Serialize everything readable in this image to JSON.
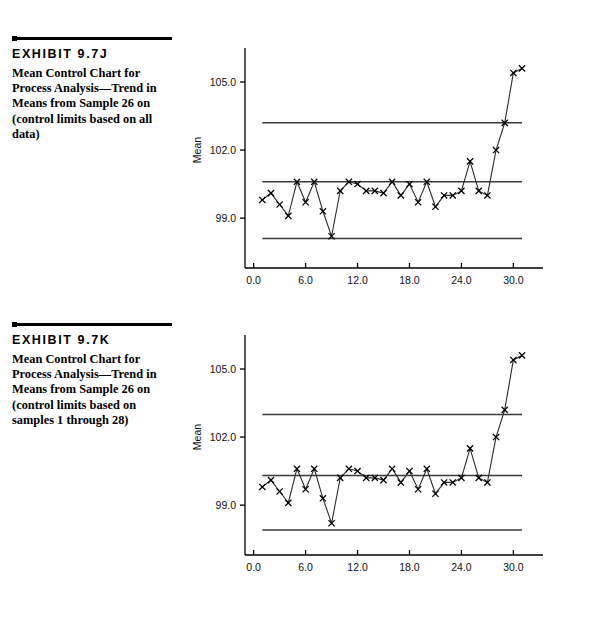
{
  "exhibits": [
    {
      "id_label": "EXHIBIT 9.7J",
      "caption": "Mean Control Chart for Process Analysis—Trend in Means from Sample 26 on (control limits based on all data)"
    },
    {
      "id_label": "EXHIBIT 9.7K",
      "caption": "Mean Control Chart for Process Analysis—Trend in Means from Sample 26 on (control limits based on samples 1 through 28)"
    }
  ],
  "chart_data": [
    {
      "type": "line",
      "title": "",
      "xlabel": "Sample  Number",
      "ylabel": "Mean",
      "xlim": [
        -1.0,
        32.5
      ],
      "ylim": [
        96.8,
        106.5
      ],
      "xticks": [
        0.0,
        6.0,
        12.0,
        18.0,
        24.0,
        30.0
      ],
      "xticklabels": [
        "0.0",
        "6.0",
        "12.0",
        "18.0",
        "24.0",
        "30.0"
      ],
      "yticks": [
        99.0,
        102.0,
        105.0
      ],
      "yticklabels": [
        "99.0",
        "102.0",
        "105.0"
      ],
      "grid": false,
      "legend": "none",
      "marker": "x",
      "control_limits": {
        "ucl": 103.2,
        "center": 100.6,
        "lcl": 98.1,
        "span_x": [
          1.0,
          31.0
        ]
      },
      "x": [
        1,
        2,
        3,
        4,
        5,
        6,
        7,
        8,
        9,
        10,
        11,
        12,
        13,
        14,
        15,
        16,
        17,
        18,
        19,
        20,
        21,
        22,
        23,
        24,
        25,
        26,
        27,
        28,
        29,
        30,
        31
      ],
      "values": [
        99.8,
        100.1,
        99.6,
        99.1,
        100.6,
        99.7,
        100.6,
        99.3,
        98.2,
        100.2,
        100.6,
        100.5,
        100.2,
        100.2,
        100.1,
        100.6,
        100.0,
        100.5,
        99.7,
        100.6,
        99.5,
        100.0,
        100.0,
        100.2,
        101.5,
        100.2,
        100.0,
        102.0,
        103.2,
        105.4,
        105.6
      ]
    },
    {
      "type": "line",
      "title": "",
      "xlabel": "Sample  Number",
      "ylabel": "Mean",
      "xlim": [
        -1.0,
        32.5
      ],
      "ylim": [
        96.8,
        106.5
      ],
      "xticks": [
        0.0,
        6.0,
        12.0,
        18.0,
        24.0,
        30.0
      ],
      "xticklabels": [
        "0.0",
        "6.0",
        "12.0",
        "18.0",
        "24.0",
        "30.0"
      ],
      "yticks": [
        99.0,
        102.0,
        105.0
      ],
      "yticklabels": [
        "99.0",
        "102.0",
        "105.0"
      ],
      "grid": false,
      "legend": "none",
      "marker": "x",
      "control_limits": {
        "ucl": 103.0,
        "center": 100.3,
        "lcl": 97.9,
        "span_x": [
          1.0,
          31.0
        ]
      },
      "x": [
        1,
        2,
        3,
        4,
        5,
        6,
        7,
        8,
        9,
        10,
        11,
        12,
        13,
        14,
        15,
        16,
        17,
        18,
        19,
        20,
        21,
        22,
        23,
        24,
        25,
        26,
        27,
        28,
        29,
        30,
        31
      ],
      "values": [
        99.8,
        100.1,
        99.6,
        99.1,
        100.6,
        99.7,
        100.6,
        99.3,
        98.2,
        100.2,
        100.6,
        100.5,
        100.2,
        100.2,
        100.1,
        100.6,
        100.0,
        100.5,
        99.7,
        100.6,
        99.5,
        100.0,
        100.0,
        100.2,
        101.5,
        100.2,
        100.0,
        102.0,
        103.2,
        105.4,
        105.6
      ]
    }
  ],
  "colors": {
    "ink": "#000000",
    "line": "#2b2b2b",
    "limit_line": "#3a3a3a"
  }
}
